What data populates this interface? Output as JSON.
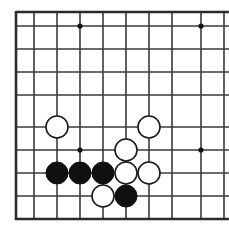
{
  "board": {
    "title": "go-board-diagram",
    "kind": "go-board",
    "background_color": "#ffffff",
    "line_color": "#3a3a3a",
    "edge_color": "#2b2b2b",
    "black_stone_color": "#101010",
    "white_stone_fill": "#ffffff",
    "white_stone_outline": "#1a1a1a",
    "star_point_color": "#101010",
    "line_width": 1.6,
    "edge_line_width": 2.6,
    "stone_radius": 11.0,
    "star_radius": 2.6,
    "columns_x": [
      16,
      34,
      57,
      80,
      103,
      126,
      149,
      172,
      195,
      218
    ],
    "rows_y": [
      12,
      26,
      49,
      72,
      95,
      127,
      150,
      173,
      196,
      219
    ],
    "visible_vertical_lines": [
      16,
      34,
      57,
      80,
      103,
      126,
      149,
      172,
      201,
      224
    ],
    "visible_horizontal_lines": [
      12,
      26,
      49,
      72,
      95,
      127,
      150,
      173,
      196,
      219
    ],
    "thick_edges": {
      "left_x": 16,
      "top_y": 12,
      "bottom_y": 219
    },
    "star_points": [
      {
        "name": "star-point-top-left",
        "x": 80,
        "y": 26
      },
      {
        "name": "star-point-top-right",
        "x": 201,
        "y": 26
      },
      {
        "name": "star-point-center-left",
        "x": 80,
        "y": 150
      },
      {
        "name": "star-point-center-right",
        "x": 201,
        "y": 150
      }
    ],
    "stones": [
      {
        "name": "white-stone-upper-left",
        "color": "white",
        "x": 57,
        "y": 127
      },
      {
        "name": "white-stone-upper-right",
        "color": "white",
        "x": 149,
        "y": 127
      },
      {
        "name": "white-stone-middle",
        "color": "white",
        "x": 126,
        "y": 150
      },
      {
        "name": "black-stone-row-left",
        "color": "black",
        "x": 57,
        "y": 173
      },
      {
        "name": "black-stone-row-center",
        "color": "black",
        "x": 80,
        "y": 173
      },
      {
        "name": "black-stone-row-right",
        "color": "black",
        "x": 103,
        "y": 173
      },
      {
        "name": "white-stone-row-right-inner",
        "color": "white",
        "x": 126,
        "y": 173
      },
      {
        "name": "white-stone-row-right-outer",
        "color": "white",
        "x": 149,
        "y": 173
      },
      {
        "name": "white-stone-bottom-left",
        "color": "white",
        "x": 103,
        "y": 196
      },
      {
        "name": "black-stone-bottom-right",
        "color": "black",
        "x": 126,
        "y": 196
      }
    ],
    "counts": {
      "black_stones": "4",
      "white_stones": "6",
      "total_stones": "10"
    }
  }
}
